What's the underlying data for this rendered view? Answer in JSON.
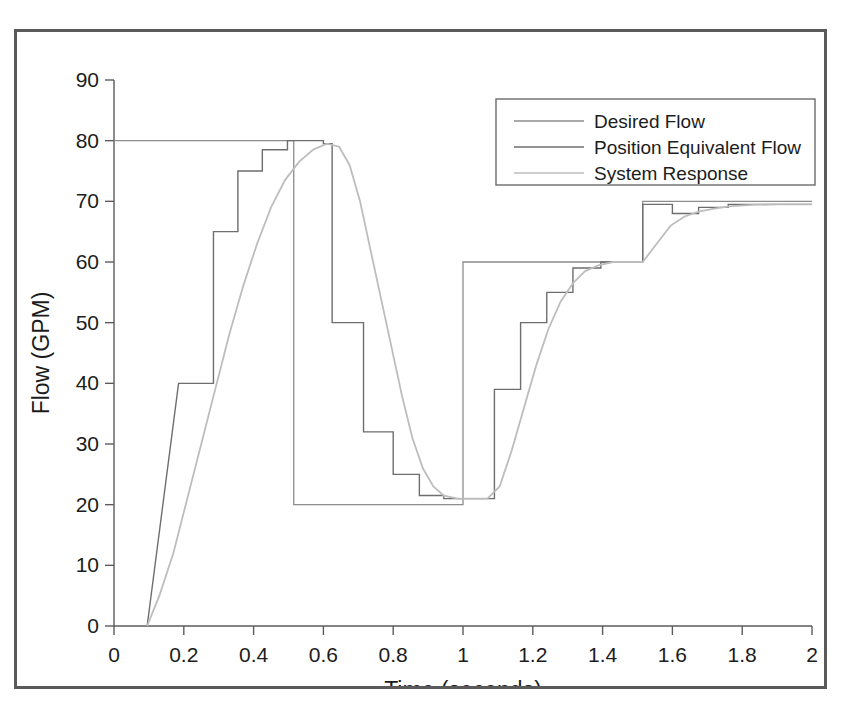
{
  "chart_data": {
    "type": "line",
    "title": "",
    "xlabel": "Time (seconds)",
    "ylabel": "Flow (GPM)",
    "xlim": [
      0,
      2
    ],
    "ylim": [
      0,
      90
    ],
    "xticks": [
      "0",
      "0.2",
      "0.4",
      "0.6",
      "0.8",
      "1",
      "1.2",
      "1.4",
      "1.6",
      "1.8",
      "2"
    ],
    "xtick_values": [
      0,
      0.2,
      0.4,
      0.6,
      0.8,
      1.0,
      1.2,
      1.4,
      1.6,
      1.8,
      2.0
    ],
    "yticks": [
      "0",
      "10",
      "20",
      "30",
      "40",
      "50",
      "60",
      "70",
      "80",
      "90"
    ],
    "ytick_values": [
      0,
      10,
      20,
      30,
      40,
      50,
      60,
      70,
      80,
      90
    ],
    "grid": false,
    "legend_position": "top-right",
    "legend": [
      "Desired Flow",
      "Position Equivalent Flow",
      "System Response"
    ],
    "series": [
      {
        "name": "Desired Flow",
        "color": "#8c8c8c",
        "width": 1.3,
        "points": [
          [
            0.0,
            80
          ],
          [
            0.515,
            80
          ],
          [
            0.515,
            20
          ],
          [
            1.0,
            20
          ],
          [
            1.0,
            60
          ],
          [
            1.515,
            60
          ],
          [
            1.515,
            70
          ],
          [
            2.0,
            70
          ]
        ]
      },
      {
        "name": "Position Equivalent Flow",
        "color": "#6e6e6e",
        "width": 1.4,
        "points": [
          [
            0.095,
            0
          ],
          [
            0.185,
            40
          ],
          [
            0.185,
            40
          ],
          [
            0.2,
            40
          ],
          [
            0.2,
            40
          ],
          [
            0.285,
            40
          ],
          [
            0.285,
            65
          ],
          [
            0.355,
            65
          ],
          [
            0.355,
            75
          ],
          [
            0.425,
            75
          ],
          [
            0.425,
            78.5
          ],
          [
            0.497,
            78.5
          ],
          [
            0.497,
            80
          ],
          [
            0.6,
            80
          ],
          [
            0.6,
            79.5
          ],
          [
            0.625,
            79.5
          ],
          [
            0.625,
            50
          ],
          [
            0.715,
            50
          ],
          [
            0.715,
            32
          ],
          [
            0.8,
            32
          ],
          [
            0.8,
            25
          ],
          [
            0.875,
            25
          ],
          [
            0.875,
            21.5
          ],
          [
            0.945,
            21.5
          ],
          [
            0.945,
            21
          ],
          [
            1.09,
            21
          ],
          [
            1.09,
            39
          ],
          [
            1.165,
            39
          ],
          [
            1.165,
            50
          ],
          [
            1.24,
            50
          ],
          [
            1.24,
            55
          ],
          [
            1.315,
            55
          ],
          [
            1.315,
            59
          ],
          [
            1.395,
            59
          ],
          [
            1.395,
            60
          ],
          [
            1.515,
            60
          ],
          [
            1.515,
            69.5
          ],
          [
            1.6,
            69.5
          ],
          [
            1.6,
            68
          ],
          [
            1.675,
            68
          ],
          [
            1.675,
            69
          ],
          [
            1.76,
            69
          ],
          [
            1.76,
            69.5
          ],
          [
            2.0,
            69.5
          ]
        ]
      },
      {
        "name": "System Response",
        "color": "#bdbdbd",
        "width": 1.8,
        "points": [
          [
            0.095,
            0
          ],
          [
            0.13,
            5
          ],
          [
            0.17,
            12
          ],
          [
            0.21,
            21
          ],
          [
            0.25,
            30
          ],
          [
            0.29,
            39
          ],
          [
            0.33,
            48
          ],
          [
            0.37,
            56
          ],
          [
            0.41,
            63
          ],
          [
            0.45,
            69
          ],
          [
            0.49,
            73.5
          ],
          [
            0.53,
            76.5
          ],
          [
            0.57,
            78.5
          ],
          [
            0.61,
            79.5
          ],
          [
            0.645,
            79
          ],
          [
            0.675,
            76
          ],
          [
            0.705,
            70
          ],
          [
            0.735,
            62
          ],
          [
            0.765,
            54
          ],
          [
            0.795,
            46
          ],
          [
            0.825,
            38
          ],
          [
            0.855,
            31
          ],
          [
            0.885,
            26
          ],
          [
            0.915,
            23
          ],
          [
            0.945,
            21.5
          ],
          [
            0.985,
            21
          ],
          [
            1.03,
            21
          ],
          [
            1.07,
            21
          ],
          [
            1.105,
            23
          ],
          [
            1.14,
            29
          ],
          [
            1.175,
            36
          ],
          [
            1.21,
            43
          ],
          [
            1.245,
            49
          ],
          [
            1.28,
            53.5
          ],
          [
            1.315,
            56.5
          ],
          [
            1.35,
            58.5
          ],
          [
            1.39,
            59.5
          ],
          [
            1.43,
            60
          ],
          [
            1.47,
            60
          ],
          [
            1.515,
            60
          ],
          [
            1.555,
            63
          ],
          [
            1.595,
            66
          ],
          [
            1.635,
            67.5
          ],
          [
            1.675,
            68.3
          ],
          [
            1.72,
            68.8
          ],
          [
            1.77,
            69.2
          ],
          [
            1.83,
            69.4
          ],
          [
            1.9,
            69.5
          ],
          [
            2.0,
            69.5
          ]
        ]
      }
    ]
  },
  "axes": {
    "y_title": "Flow (GPM)",
    "x_title": "Time (seconds)"
  }
}
